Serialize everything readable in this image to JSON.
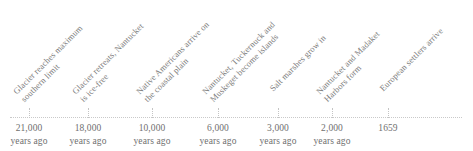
{
  "figure": {
    "type": "timeline",
    "background_color": "#ffffff",
    "axis_color": "#c9c9c9",
    "text_color": "#7a7a7a",
    "tick_label_color": "#6f6f6f",
    "label_rotation_degrees": -45,
    "axis": {
      "orientation": "horizontal",
      "start_px": 10,
      "end_px": 462,
      "y_px": 117
    }
  },
  "chart_data": {
    "type": "table",
    "title": "",
    "xlabel": "",
    "ylabel": "",
    "grid": false,
    "legend": "none",
    "categories": [
      "21,000 years ago",
      "18,000 years ago",
      "10,000 years ago",
      "6,000 years ago",
      "3,000 years ago",
      "2,000 years ago",
      "1659"
    ],
    "values": [
      21000,
      18000,
      10000,
      6000,
      3000,
      2000,
      1659
    ],
    "annotations": [
      "Glacier reaches maximum southern limit",
      "Glacier retreats, Nantucket is ice-free",
      "Native Americans arrive on the coastal plain",
      "Nantucket, Tuckernuck and Muskeget become islands",
      "Salt marshes grow in",
      "Nantucket and Madaket Harbors form",
      "European settlers arrive"
    ]
  },
  "events": [
    {
      "tick_x": 29,
      "value": "21,000",
      "unit": "years ago",
      "label_lines": [
        "Glacier reaches maximum",
        "southern limit"
      ],
      "label_x": 26,
      "label_y": 105
    },
    {
      "tick_x": 88,
      "value": "18,000",
      "unit": "years ago",
      "label_lines": [
        "Glacier retreats, Nantucket",
        "is ice-free"
      ],
      "label_x": 85,
      "label_y": 105
    },
    {
      "tick_x": 152,
      "value": "10,000",
      "unit": "years ago",
      "label_lines": [
        "Native Americans arrive on",
        "the coastal plain"
      ],
      "label_x": 149,
      "label_y": 105
    },
    {
      "tick_x": 218,
      "value": "6,000",
      "unit": "years ago",
      "label_lines": [
        "Nantucket, Tuckernuck and",
        "Muskeget become islands"
      ],
      "label_x": 215,
      "label_y": 105
    },
    {
      "tick_x": 278,
      "value": "3,000",
      "unit": "years ago",
      "label_lines": [
        "Salt marshes grow in"
      ],
      "label_x": 275,
      "label_y": 105
    },
    {
      "tick_x": 332,
      "value": "2,000",
      "unit": "years ago",
      "label_lines": [
        "Nantucket and Madaket",
        "Harbors form"
      ],
      "label_x": 329,
      "label_y": 105
    },
    {
      "tick_x": 388,
      "value": "1659",
      "unit": "",
      "label_lines": [
        "European settlers arrive"
      ],
      "label_x": 385,
      "label_y": 105
    }
  ]
}
